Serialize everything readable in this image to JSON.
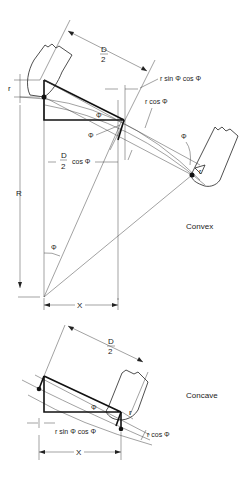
{
  "convex": {
    "title": "Convex",
    "labels": {
      "half_diameter_num": "D",
      "half_diameter_den": "2",
      "r_top": "r",
      "r_sin_cos": "r sin Φ cos Φ",
      "r_cos": "r cos Φ",
      "phi_triangle": "Φ",
      "phi_left": "Φ",
      "phi_right": "Φ",
      "phi_center": "Φ",
      "half_d_cos_num": "D",
      "half_d_cos_den": "2",
      "half_d_cos_suffix": "cos Φ",
      "radius": "R",
      "r_right": "r",
      "x": "X"
    }
  },
  "concave": {
    "title": "Concave",
    "labels": {
      "half_diameter_num": "D",
      "half_diameter_den": "2",
      "phi_triangle": "Φ",
      "r_right": "r",
      "r_sin_cos": "r sin Φ cos Φ",
      "r_cos": "r cos Φ",
      "x": "X"
    }
  }
}
